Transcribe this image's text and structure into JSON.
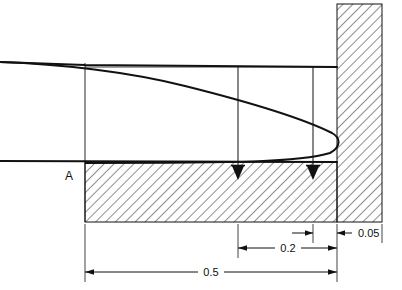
{
  "figure": {
    "type": "engineering-cross-section-diagram",
    "title": "",
    "background_color": "#ffffff",
    "line_color": "#111111",
    "hatch_color": "#333333",
    "labels": {
      "point_a": "A",
      "dim_small": "0.05",
      "dim_mid": "0.2",
      "dim_large": "0.5"
    },
    "geometry": {
      "upper_streamline_y_left": 62,
      "upper_streamline_y_right": 67,
      "lower_streamline_y": 161,
      "hatched_base_left": 85,
      "hatched_base_right": 337,
      "hatched_base_top": 162,
      "hatched_base_bottom": 222,
      "wall_block_left": 337,
      "wall_block_right": 382,
      "wall_block_top": 4,
      "wall_block_bottom": 222,
      "station_1_x": 238,
      "station_2_x": 313,
      "curve_apex_x": 339,
      "curve_apex_y": 126
    },
    "dimensions": [
      {
        "name": "wall-thickness",
        "value": "0.05",
        "from_x": 337,
        "to_x": 382,
        "y": 233,
        "arrow": "left"
      },
      {
        "name": "station-2-to-wall",
        "value": "",
        "from_x": 290,
        "to_x": 313,
        "y": 233,
        "arrow": "right"
      },
      {
        "name": "station-1-to-wall",
        "value": "0.2",
        "from_x": 238,
        "to_x": 337,
        "y": 248,
        "arrow": "both"
      },
      {
        "name": "origin-to-wall",
        "value": "0.5",
        "from_x": 85,
        "to_x": 337,
        "y": 272,
        "arrow": "both"
      }
    ],
    "markers": [
      {
        "name": "flow-arrow-1",
        "x": 238,
        "y": 172
      },
      {
        "name": "flow-arrow-2",
        "x": 313,
        "y": 172
      }
    ]
  }
}
